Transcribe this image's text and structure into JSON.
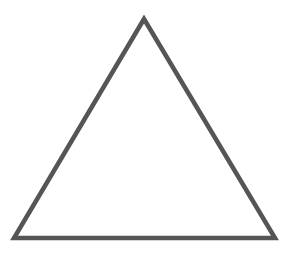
{
  "diagram": {
    "shape": "triangle",
    "type": "equilateral-outline",
    "vertices": [
      {
        "name": "apex",
        "x": 144,
        "y": 19
      },
      {
        "name": "bottom-left",
        "x": 14,
        "y": 238
      },
      {
        "name": "bottom-right",
        "x": 275,
        "y": 238
      }
    ],
    "stroke_color": "#555555",
    "stroke_width": 4.5,
    "fill_color": "#ffffff",
    "background_color": "#ffffff"
  }
}
